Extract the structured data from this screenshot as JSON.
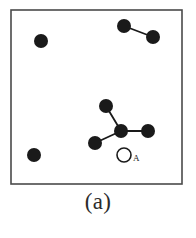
{
  "figure": {
    "caption": "(a)",
    "label_A": "A",
    "colors": {
      "particle_fill": "#1a1a1a",
      "bond_stroke": "#1a1a1a",
      "box_stroke": "#4a4a4a",
      "background": "#ffffff",
      "open_marker_stroke": "#1a1a1a"
    },
    "box": {
      "x": 11,
      "y": 10,
      "width": 171,
      "height": 174,
      "stroke_width": 1.6
    },
    "particle_radius": 7.0,
    "open_marker": {
      "cx": 124,
      "cy": 155,
      "r": 7.0,
      "stroke_width": 1.6,
      "label": "A",
      "label_x": 133,
      "label_y": 161
    },
    "particles": [
      {
        "id": "p1",
        "cx": 41,
        "cy": 41,
        "group": "isolated"
      },
      {
        "id": "p2",
        "cx": 34,
        "cy": 155,
        "group": "isolated"
      },
      {
        "id": "p3",
        "cx": 124,
        "cy": 26,
        "group": "dimer"
      },
      {
        "id": "p4",
        "cx": 153,
        "cy": 37,
        "group": "dimer"
      },
      {
        "id": "p5",
        "cx": 106,
        "cy": 106,
        "group": "tetramer"
      },
      {
        "id": "p6",
        "cx": 121,
        "cy": 131,
        "group": "tetramer"
      },
      {
        "id": "p7",
        "cx": 148,
        "cy": 131,
        "group": "tetramer"
      },
      {
        "id": "p8",
        "cx": 95,
        "cy": 143,
        "group": "tetramer"
      }
    ],
    "bonds": [
      {
        "id": "b1",
        "from": "p3",
        "to": "p4",
        "x1": 124,
        "y1": 26,
        "x2": 153,
        "y2": 37
      },
      {
        "id": "b2",
        "from": "p5",
        "to": "p6",
        "x1": 106,
        "y1": 106,
        "x2": 121,
        "y2": 131
      },
      {
        "id": "b3",
        "from": "p6",
        "to": "p7",
        "x1": 121,
        "y1": 131,
        "x2": 148,
        "y2": 131
      },
      {
        "id": "b4",
        "from": "p6",
        "to": "p8",
        "x1": 121,
        "y1": 131,
        "x2": 95,
        "y2": 143
      }
    ],
    "bond_stroke_width": 1.8
  }
}
